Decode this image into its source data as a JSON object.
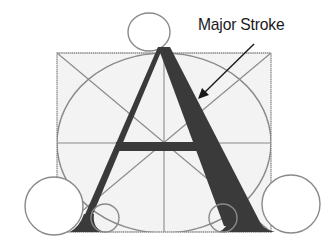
{
  "diagram": {
    "glyph": "A",
    "annotation": {
      "label": "Major Stroke",
      "target": "right diagonal stroke of A"
    },
    "elements": {
      "construction_square": "bounding square with diagonals and center lines",
      "inscribed_circle": "large circle inscribed in square",
      "apex_circle": "small circle at apex",
      "serif_circles": [
        "bottom-left large circle",
        "bottom-left small circle",
        "bottom-right small circle",
        "bottom-right large circle"
      ]
    },
    "colors": {
      "glyph": "#3a3a3a",
      "construction_lines": "#8a8a8a",
      "square_fill": "#f3f3f3",
      "label": "#1a1a1a",
      "arrow": "#1a1a1a"
    }
  }
}
